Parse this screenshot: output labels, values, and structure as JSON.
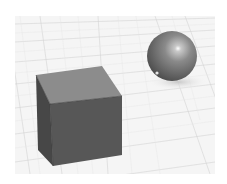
{
  "scene": {
    "description": "3D render of a gray cube and a glossy sphere on a gridded ground plane",
    "objects": [
      {
        "type": "cube",
        "label": "cube"
      },
      {
        "type": "sphere",
        "label": "sphere"
      }
    ],
    "colors": {
      "background": "#ffffff",
      "ground": "#f4f4f4",
      "grid_line": "#cfcfcf",
      "cube_top": "#8a8a8a",
      "cube_front": "#555555",
      "cube_left": "#474747",
      "sphere_base": "#6a6a6a",
      "sphere_highlight": "#ffffff",
      "shadow": "#d8d8d8"
    }
  }
}
